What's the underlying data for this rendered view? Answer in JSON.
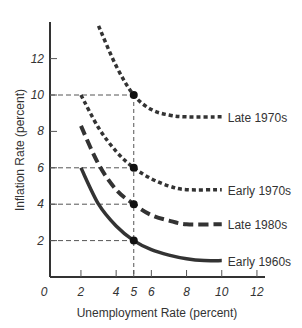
{
  "chart_data": {
    "type": "line",
    "title": "",
    "xlabel": "Unemployment Rate (percent)",
    "ylabel": "Inflation Rate (percent)",
    "xlim": [
      0,
      13
    ],
    "ylim": [
      0,
      14
    ],
    "x_ticks": [
      "0",
      "2",
      "4",
      "5",
      "6",
      "8",
      "10",
      "12"
    ],
    "y_ticks": [
      "2",
      "4",
      "6",
      "8",
      "10",
      "12"
    ],
    "grid": false,
    "legend": "inline labels at right end of each curve",
    "series": [
      {
        "name": "Late 1970s",
        "style": "short-dash",
        "points": [
          [
            3,
            13.8
          ],
          [
            4,
            11.6
          ],
          [
            5,
            10
          ],
          [
            6,
            9.2
          ],
          [
            7,
            8.9
          ],
          [
            8,
            8.8
          ],
          [
            10,
            8.8
          ]
        ]
      },
      {
        "name": "Early 1970s",
        "style": "short-dash",
        "points": [
          [
            2,
            10
          ],
          [
            3,
            8.2
          ],
          [
            4,
            6.9
          ],
          [
            5,
            6
          ],
          [
            6,
            5.4
          ],
          [
            7,
            5
          ],
          [
            8,
            4.8
          ],
          [
            10,
            4.8
          ]
        ]
      },
      {
        "name": "Late 1980s",
        "style": "long-dash",
        "points": [
          [
            2,
            8.3
          ],
          [
            3,
            6.2
          ],
          [
            4,
            4.8
          ],
          [
            5,
            4
          ],
          [
            6,
            3.4
          ],
          [
            7,
            3.1
          ],
          [
            8,
            2.9
          ],
          [
            10,
            2.9
          ]
        ]
      },
      {
        "name": "Early 1960s",
        "style": "solid",
        "points": [
          [
            2,
            6
          ],
          [
            3,
            4
          ],
          [
            4,
            2.8
          ],
          [
            5,
            2
          ],
          [
            6,
            1.5
          ],
          [
            7,
            1.2
          ],
          [
            8,
            1.0
          ],
          [
            9,
            0.9
          ],
          [
            10,
            0.9
          ]
        ]
      }
    ],
    "annotations": [
      {
        "type": "point",
        "x": 5,
        "y": 10
      },
      {
        "type": "point",
        "x": 5,
        "y": 6
      },
      {
        "type": "point",
        "x": 5,
        "y": 4
      },
      {
        "type": "point",
        "x": 5,
        "y": 2
      },
      {
        "type": "guide-line",
        "orientation": "vertical",
        "x": 5
      },
      {
        "type": "guide-line",
        "orientation": "horizontal",
        "y": [
          10,
          6,
          4,
          2
        ]
      }
    ]
  },
  "axes": {
    "x_title": "Unemployment Rate (percent)",
    "y_title": "Inflation Rate (percent)",
    "origin_label": "0"
  },
  "labels": {
    "late_1970s": "Late 1970s",
    "early_1970s": "Early 1970s",
    "late_1980s": "Late 1980s",
    "early_1960s": "Early 1960s"
  }
}
